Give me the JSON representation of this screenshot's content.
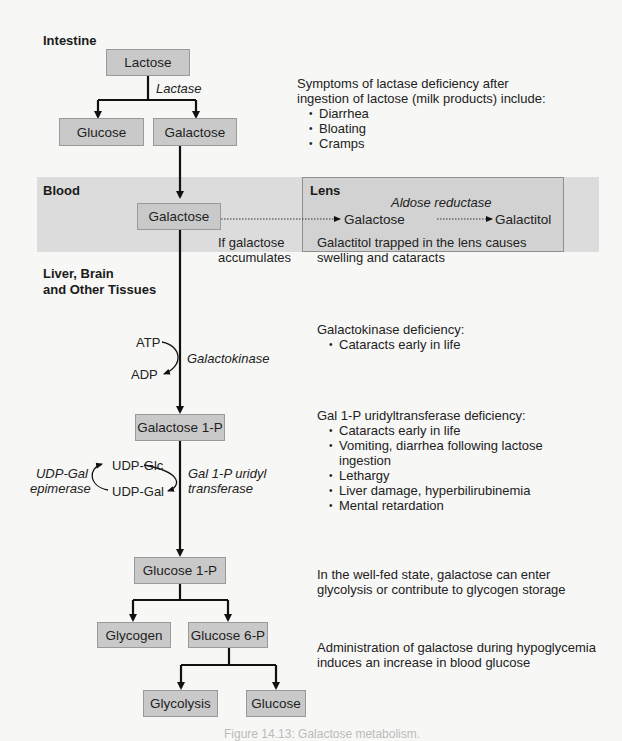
{
  "regions": {
    "intestine": "Intestine",
    "blood": "Blood",
    "lens": "Lens",
    "liver_line1": "Liver, Brain",
    "liver_line2": "and Other Tissues"
  },
  "nodes": {
    "lactose": "Lactose",
    "glucose_top": "Glucose",
    "galactose_intestine": "Galactose",
    "galactose_blood": "Galactose",
    "galactose_lens": "Galactose",
    "galactitol": "Galactitol",
    "galactose_1p": "Galactose 1-P",
    "udp_glc": "UDP-Glc",
    "udp_gal": "UDP-Gal",
    "atp": "ATP",
    "adp": "ADP",
    "glucose_1p": "Glucose 1-P",
    "glycogen": "Glycogen",
    "glucose_6p": "Glucose 6-P",
    "glycolysis": "Glycolysis",
    "glucose_bottom": "Glucose"
  },
  "enzymes": {
    "lactase": "Lactase",
    "aldose_reductase": "Aldose reductase",
    "galactokinase": "Galactokinase",
    "uridyl_line1": "Gal 1-P uridyl",
    "uridyl_line2": "transferase",
    "epimerase_line1": "UDP-Gal",
    "epimerase_line2": "epimerase"
  },
  "annotations": {
    "accumulates_line1": "If galactose",
    "accumulates_line2": "accumulates",
    "lens_note_line1": "Galactitol trapped in the lens causes",
    "lens_note_line2": "swelling and cataracts",
    "lactase_def": {
      "line1": "Symptoms of lactase deficiency after",
      "line2": "ingestion of lactose (milk products) include:",
      "items": [
        "Diarrhea",
        "Bloating",
        "Cramps"
      ]
    },
    "galactokinase_def": {
      "title": "Galactokinase deficiency:",
      "items": [
        "Cataracts early in life"
      ]
    },
    "transferase_def": {
      "title": "Gal 1-P uridyltransferase deficiency:",
      "items": [
        "Cataracts early in life",
        "Vomiting, diarrhea following lactose",
        "Lethargy",
        "Liver damage, hyperbilirubinemia",
        "Mental retardation"
      ],
      "item2_cont": "ingestion"
    },
    "well_fed": {
      "line1": "In the well-fed state, galactose can enter",
      "line2": "glycolysis or contribute to glycogen storage"
    },
    "hypoglycemia": {
      "line1": "Administration of galactose during hypoglycemia",
      "line2": "induces an increase in blood glucose"
    }
  },
  "caption": "Figure 14.13: Galactose metabolism.",
  "colors": {
    "box_fill": "#c9c9c9",
    "band_fill": "#dcdcdc",
    "arrow": "#111111"
  }
}
